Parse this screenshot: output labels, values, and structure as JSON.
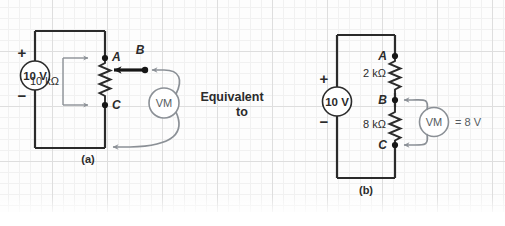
{
  "figure": {
    "middle_text_line1": "Equivalent",
    "middle_text_line2": "to",
    "caption_a": "(a)",
    "caption_b": "(b)"
  },
  "colors": {
    "wire": "#2b2b2b",
    "lead": "#8b9096",
    "text": "#2b2b2b",
    "grid_minor": "#f0f0f0",
    "grid_major": "#dcdcdc",
    "background": "#fdfdfd"
  },
  "circuit_a": {
    "source": {
      "label": "10 V",
      "plus": "+",
      "minus": "−"
    },
    "resistor": {
      "label": "10 kΩ"
    },
    "nodes": [
      {
        "id": "A",
        "label": "A"
      },
      {
        "id": "B",
        "label": "B"
      },
      {
        "id": "C",
        "label": "C"
      }
    ],
    "meter": {
      "label": "VM"
    }
  },
  "circuit_b": {
    "source": {
      "label": "10 V",
      "plus": "+",
      "minus": "−"
    },
    "resistors": [
      {
        "id": "R1",
        "label": "2 kΩ"
      },
      {
        "id": "R2",
        "label": "8 kΩ"
      }
    ],
    "nodes": [
      {
        "id": "A",
        "label": "A"
      },
      {
        "id": "B",
        "label": "B"
      },
      {
        "id": "C",
        "label": "C"
      }
    ],
    "meter": {
      "label": "VM"
    },
    "reading": "= 8 V"
  }
}
